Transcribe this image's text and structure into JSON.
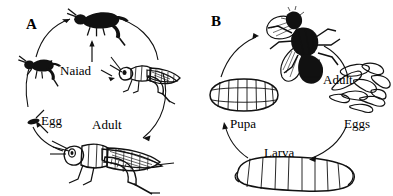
{
  "figure": {
    "background_color": "#ffffff",
    "ink_color": "#111111",
    "width": 393,
    "height": 196
  },
  "panels": [
    {
      "letter": "A",
      "name": "incomplete-metamorphosis-grasshopper",
      "cycle_direction": "clockwise",
      "labels": [
        {
          "text": "Naiad",
          "name": "label-naiad",
          "x": 60,
          "y": 64
        },
        {
          "text": "Egg",
          "name": "label-egg",
          "x": 41,
          "y": 114
        },
        {
          "text": "Adult",
          "name": "label-adult",
          "x": 92,
          "y": 118
        }
      ],
      "organisms": [
        {
          "name": "nymph-early-instar",
          "stage": "naiad"
        },
        {
          "name": "nymph-mid-instar",
          "stage": "naiad"
        },
        {
          "name": "nymph-late-instar",
          "stage": "naiad"
        },
        {
          "name": "grasshopper-adult",
          "stage": "adult"
        },
        {
          "name": "egg-mass",
          "stage": "egg"
        }
      ]
    },
    {
      "letter": "B",
      "name": "complete-metamorphosis-fly",
      "cycle_direction": "clockwise",
      "labels": [
        {
          "text": "Adult",
          "name": "label-adult",
          "x": 127,
          "y": 73
        },
        {
          "text": "Eggs",
          "name": "label-eggs",
          "x": 148,
          "y": 117
        },
        {
          "text": "Pupa",
          "name": "label-pupa",
          "x": 34,
          "y": 117
        },
        {
          "text": "Larva",
          "name": "label-larva",
          "x": 68,
          "y": 146
        }
      ],
      "organisms": [
        {
          "name": "fly-adult",
          "stage": "adult"
        },
        {
          "name": "egg-cluster",
          "stage": "eggs"
        },
        {
          "name": "maggot-larva",
          "stage": "larva"
        },
        {
          "name": "fly-pupa-puparium",
          "stage": "pupa"
        }
      ]
    }
  ]
}
